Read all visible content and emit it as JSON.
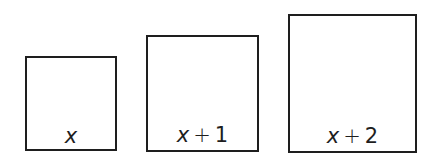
{
  "diagram": {
    "type": "square-sequence",
    "stroke_color": "#1e1e1e",
    "background": "#ffffff",
    "squares": [
      {
        "id": "square-1",
        "variable": "x",
        "operator": "",
        "constant": "",
        "label": "x",
        "box": {
          "left": 25,
          "top": 56,
          "width": 92,
          "height": 95
        }
      },
      {
        "id": "square-2",
        "variable": "x",
        "operator": "+",
        "constant": "1",
        "label": "x + 1",
        "box": {
          "left": 146,
          "top": 35,
          "width": 113,
          "height": 117
        }
      },
      {
        "id": "square-3",
        "variable": "x",
        "operator": "+",
        "constant": "2",
        "label": "x + 2",
        "box": {
          "left": 288,
          "top": 14,
          "width": 129,
          "height": 139
        }
      }
    ]
  }
}
